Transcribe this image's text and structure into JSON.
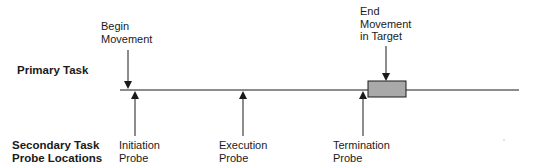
{
  "labels": {
    "primary_task": "Primary Task",
    "secondary_line1": "Secondary Task",
    "secondary_line2": "Probe Locations"
  },
  "events": {
    "begin": {
      "line1": "Begin",
      "line2": "Movement"
    },
    "end": {
      "line1": "End",
      "line2": "Movement",
      "line3": "in Target"
    }
  },
  "probes": [
    {
      "line1": "Initiation",
      "line2": "Probe"
    },
    {
      "line1": "Execution",
      "line2": "Probe"
    },
    {
      "line1": "Termination",
      "line2": "Probe"
    }
  ],
  "colors": {
    "line": "#1a1a1a",
    "target_box_fill": "#a9a9a9"
  }
}
